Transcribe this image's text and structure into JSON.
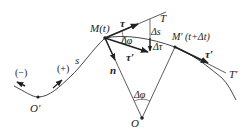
{
  "diagram": {
    "title": "",
    "type": "natural-coordinates-tangent-vector-derivation",
    "points": {
      "M": {
        "label": "M(t)",
        "x": 105,
        "y": 38
      },
      "M_prime": {
        "label": "M′ (t+Δt)",
        "x": 175,
        "y": 47
      },
      "O": {
        "label": "O",
        "x": 142,
        "y": 118
      },
      "O_prime": {
        "label": "O′",
        "x": 38,
        "y": 97
      }
    },
    "lines": {
      "T": {
        "label": "T"
      },
      "T_prime": {
        "label": "T′"
      }
    },
    "vectors": {
      "tau": {
        "label": "τ"
      },
      "tau_prime": {
        "label": "τ′"
      },
      "tau_prime_at_M_prime": {
        "label": "τ′"
      },
      "delta_tau": {
        "label": "Δτ"
      },
      "n": {
        "label": "n"
      }
    },
    "annotations": {
      "arc_length": "s",
      "delta_s": "Δs",
      "delta_phi_top": "Δφ",
      "delta_phi_bottom": "Δφ",
      "negative_direction": "(−)",
      "positive_direction": "(+)"
    },
    "colors": {
      "stroke": "#333333",
      "background": "#ffffff"
    }
  }
}
